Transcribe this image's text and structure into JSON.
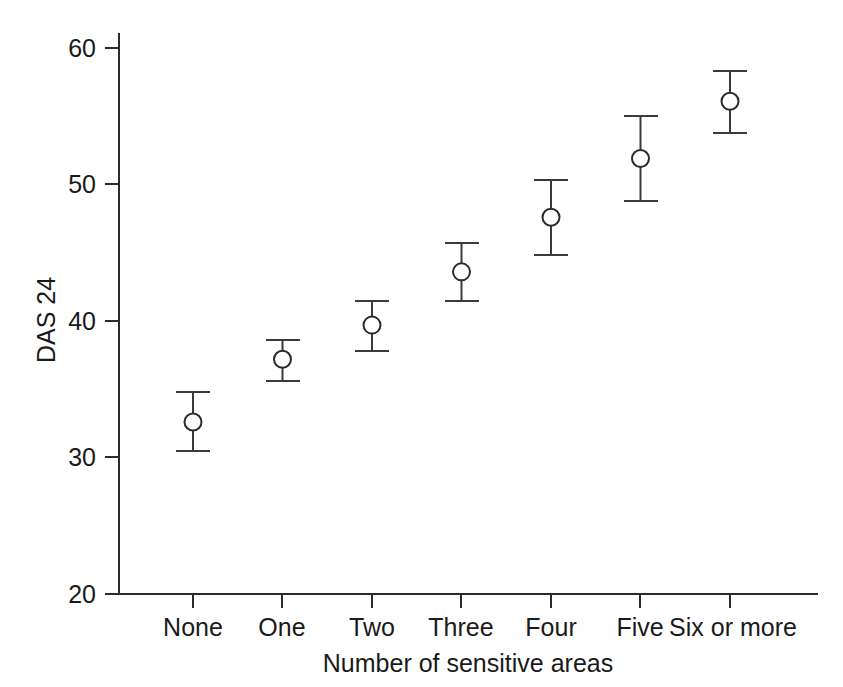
{
  "chart_data": {
    "type": "scatter",
    "title": "",
    "subtitle": "",
    "xlabel": "Number of sensitive areas",
    "ylabel": "DAS 24",
    "categories": [
      "None",
      "One",
      "Two",
      "Three",
      "Four",
      "Five",
      "Six or more"
    ],
    "values": [
      32.6,
      37.2,
      39.7,
      43.6,
      47.6,
      51.9,
      56.1
    ],
    "error_low": [
      30.5,
      35.6,
      37.8,
      41.5,
      44.8,
      48.8,
      53.8
    ],
    "error_high": [
      34.8,
      38.6,
      41.5,
      45.7,
      50.3,
      55.0,
      58.3
    ],
    "series": [
      {
        "name": "DAS 24 mean with 95% confidence interval",
        "values": [
          32.6,
          37.2,
          39.7,
          43.6,
          47.6,
          51.9,
          56.1
        ]
      }
    ],
    "ylim": [
      20,
      60
    ],
    "yticks": [
      20,
      30,
      40,
      50,
      60
    ],
    "ytick_labels": [
      "20",
      "30",
      "40",
      "50",
      "60"
    ],
    "xtick_labels": [
      "None",
      "One",
      "Two",
      "Three",
      "Four",
      "Five",
      "Six or more"
    ],
    "grid": false,
    "legend": false,
    "legend_position": "none",
    "marker": "open-circle",
    "error_bar_style": "capped-vertical"
  },
  "axes": {
    "y_title": "DAS 24",
    "x_title": "Number of sensitive areas"
  }
}
